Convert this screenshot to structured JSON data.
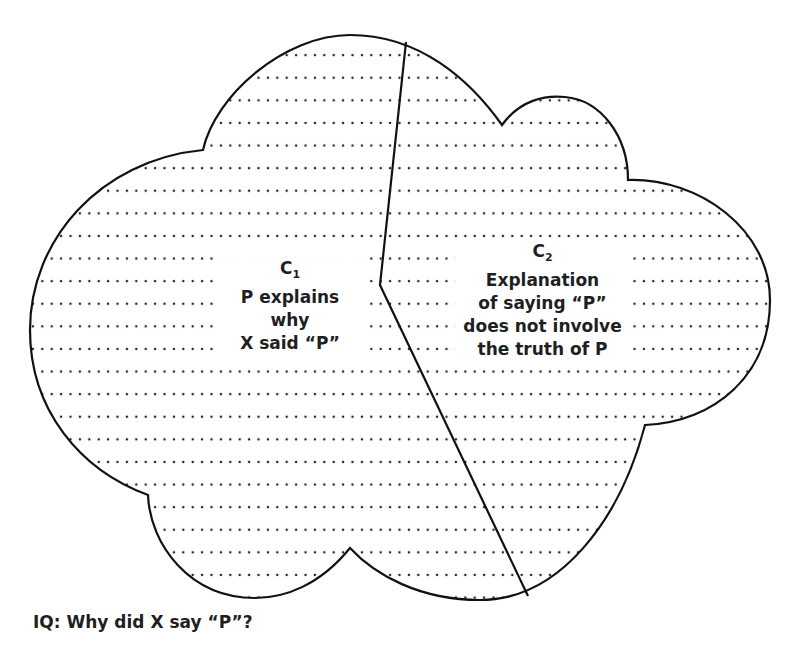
{
  "diagram": {
    "type": "cloud-partition",
    "regions": [
      {
        "id": "C1",
        "letter": "C",
        "subscript": "1",
        "lines": [
          "P explains",
          "why",
          "X said “P”"
        ]
      },
      {
        "id": "C2",
        "letter": "C",
        "subscript": "2",
        "lines": [
          "Explanation",
          "of saying “P”",
          "does not involve",
          "the truth of P"
        ]
      }
    ],
    "caption": "IQ: Why did X say “P”?",
    "colors": {
      "outline": "#111111",
      "dots": "#222222",
      "background": "#ffffff"
    },
    "fill_pattern": "dotted-horizontal-rows"
  }
}
